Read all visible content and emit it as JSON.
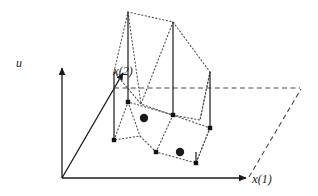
{
  "figure": {
    "type": "3d-stem-plot",
    "title": "",
    "background_color": "#ffffff",
    "line_color": "#1a1a1a",
    "dotted_color": "#555555",
    "dashed_color": "#555555",
    "marker_color": "#111111",
    "labels": {
      "u_axis": "u",
      "x1_axis": "x",
      "x1_superscript": "(1)",
      "x2_axis": "x",
      "x2_superscript": "(2)"
    },
    "axes": {
      "origin": [
        62,
        178
      ],
      "u_axis_top": [
        62,
        66
      ],
      "x1_axis_right": [
        248,
        178
      ],
      "x2_axis_tip": [
        124,
        72
      ]
    },
    "ground_plane": {
      "style": "dashed",
      "points": [
        [
          62,
          178
        ],
        [
          248,
          178
        ],
        [
          300,
          88
        ],
        [
          114,
          88
        ]
      ],
      "drawn_edges": [
        [
          [
            114,
            88
          ],
          [
            300,
            88
          ]
        ],
        [
          [
            248,
            178
          ],
          [
            300,
            88
          ]
        ]
      ]
    },
    "upper_polygon": {
      "style": "dotted",
      "vertices": [
        [
          128,
          12
        ],
        [
          173,
          22
        ],
        [
          210,
          72
        ],
        [
          200,
          120
        ],
        [
          172,
          115
        ],
        [
          141,
          104
        ],
        [
          114,
          72
        ]
      ]
    },
    "lower_polygon": {
      "style": "dotted",
      "vertices": [
        [
          128,
          102
        ],
        [
          172,
          115
        ],
        [
          210,
          128
        ],
        [
          196,
          163
        ],
        [
          156,
          152
        ],
        [
          140,
          136
        ],
        [
          114,
          140
        ]
      ]
    },
    "stems": [
      {
        "id": "stem-1",
        "x": 114,
        "top": 72,
        "bottom": 140,
        "marker": "square"
      },
      {
        "id": "stem-2",
        "x": 128,
        "top": 12,
        "bottom": 102,
        "marker": "square"
      },
      {
        "id": "stem-3",
        "x": 173,
        "top": 22,
        "bottom": 115,
        "marker": "square"
      },
      {
        "id": "stem-4",
        "x": 210,
        "top": 72,
        "bottom": 128,
        "marker": "square"
      },
      {
        "id": "stem-5",
        "x": 196,
        "top": 152,
        "bottom": 163,
        "marker": "square"
      }
    ],
    "small_markers": [
      {
        "id": "marker-a",
        "x": 114,
        "y": 140
      },
      {
        "id": "marker-b",
        "x": 128,
        "y": 102
      },
      {
        "id": "marker-c",
        "x": 173,
        "y": 115
      },
      {
        "id": "marker-d",
        "x": 210,
        "y": 128
      },
      {
        "id": "marker-e",
        "x": 156,
        "y": 152
      },
      {
        "id": "marker-f",
        "x": 196,
        "y": 163
      }
    ],
    "large_dots": [
      {
        "id": "dot-1",
        "x": 144,
        "y": 118,
        "r": 4.2
      },
      {
        "id": "dot-2",
        "x": 180,
        "y": 152,
        "r": 4.2
      }
    ]
  }
}
